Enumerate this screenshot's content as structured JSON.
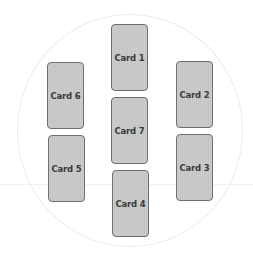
{
  "diagram": {
    "type": "card-spread-layout",
    "colors": {
      "card_fill": "#c9c9c9",
      "card_border": "#6e6e6e",
      "label": "#3a3a3a",
      "circle_outline": "#ececec"
    },
    "cards": [
      {
        "label": "Card 1",
        "x": 111,
        "y": 24
      },
      {
        "label": "Card 2",
        "x": 176,
        "y": 61
      },
      {
        "label": "Card 3",
        "x": 176,
        "y": 134
      },
      {
        "label": "Card 4",
        "x": 112,
        "y": 170
      },
      {
        "label": "Card 5",
        "x": 48,
        "y": 135
      },
      {
        "label": "Card 6",
        "x": 47,
        "y": 62
      },
      {
        "label": "Card 7",
        "x": 111,
        "y": 97
      }
    ]
  }
}
